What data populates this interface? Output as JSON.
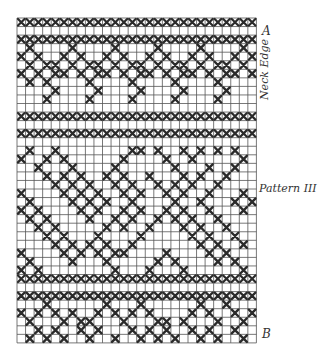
{
  "labels": {
    "top_marker": "A",
    "bottom_marker": "B",
    "neck_edge": "Neck Edge",
    "pattern": "Pattern III"
  },
  "grid": {
    "origin_x": 17,
    "origin_y": 18,
    "cell": 8.55,
    "cols": 28,
    "rows": 38,
    "line_color": "#555555",
    "stitch_color": "#2a2a2a"
  },
  "band_rows": [
    0,
    2,
    11,
    13,
    30,
    32
  ],
  "crosses": [
    [
      3,
      1
    ],
    [
      3,
      6
    ],
    [
      3,
      11
    ],
    [
      3,
      16
    ],
    [
      3,
      21
    ],
    [
      3,
      26
    ],
    [
      4,
      0
    ],
    [
      4,
      2
    ],
    [
      4,
      5
    ],
    [
      4,
      7
    ],
    [
      4,
      10
    ],
    [
      4,
      12
    ],
    [
      4,
      15
    ],
    [
      4,
      17
    ],
    [
      4,
      20
    ],
    [
      4,
      22
    ],
    [
      4,
      25
    ],
    [
      4,
      27
    ],
    [
      5,
      1
    ],
    [
      5,
      3
    ],
    [
      5,
      4
    ],
    [
      5,
      6
    ],
    [
      5,
      8
    ],
    [
      5,
      9
    ],
    [
      5,
      11
    ],
    [
      5,
      13
    ],
    [
      5,
      14
    ],
    [
      5,
      16
    ],
    [
      5,
      18
    ],
    [
      5,
      19
    ],
    [
      5,
      21
    ],
    [
      5,
      23
    ],
    [
      5,
      24
    ],
    [
      5,
      26
    ],
    [
      6,
      0
    ],
    [
      6,
      2
    ],
    [
      6,
      4
    ],
    [
      6,
      5
    ],
    [
      6,
      7
    ],
    [
      6,
      9
    ],
    [
      6,
      10
    ],
    [
      6,
      12
    ],
    [
      6,
      14
    ],
    [
      6,
      15
    ],
    [
      6,
      17
    ],
    [
      6,
      19
    ],
    [
      6,
      20
    ],
    [
      6,
      22
    ],
    [
      6,
      24
    ],
    [
      6,
      25
    ],
    [
      6,
      27
    ],
    [
      7,
      1
    ],
    [
      7,
      3
    ],
    [
      7,
      8
    ],
    [
      7,
      13
    ],
    [
      7,
      18
    ],
    [
      7,
      23
    ],
    [
      8,
      4
    ],
    [
      8,
      9
    ],
    [
      8,
      14
    ],
    [
      8,
      19
    ],
    [
      8,
      24
    ],
    [
      9,
      3
    ],
    [
      9,
      8
    ],
    [
      9,
      13
    ],
    [
      9,
      18
    ],
    [
      9,
      23
    ],
    [
      15,
      1
    ],
    [
      15,
      4
    ],
    [
      15,
      13
    ],
    [
      15,
      14
    ],
    [
      15,
      16
    ],
    [
      15,
      19
    ],
    [
      15,
      21
    ],
    [
      15,
      23
    ],
    [
      15,
      25
    ],
    [
      16,
      0
    ],
    [
      16,
      3
    ],
    [
      16,
      5
    ],
    [
      16,
      12
    ],
    [
      16,
      17
    ],
    [
      16,
      20
    ],
    [
      16,
      26
    ],
    [
      17,
      2
    ],
    [
      17,
      6
    ],
    [
      17,
      11
    ],
    [
      17,
      18
    ],
    [
      17,
      22
    ],
    [
      17,
      25
    ],
    [
      18,
      3
    ],
    [
      18,
      5
    ],
    [
      18,
      7
    ],
    [
      18,
      10
    ],
    [
      18,
      12
    ],
    [
      18,
      15
    ],
    [
      18,
      19
    ],
    [
      18,
      21
    ],
    [
      18,
      24
    ],
    [
      19,
      4
    ],
    [
      19,
      6
    ],
    [
      19,
      8
    ],
    [
      19,
      11
    ],
    [
      19,
      13
    ],
    [
      19,
      16
    ],
    [
      19,
      18
    ],
    [
      19,
      20
    ],
    [
      19,
      23
    ],
    [
      20,
      0
    ],
    [
      20,
      5
    ],
    [
      20,
      7
    ],
    [
      20,
      9
    ],
    [
      20,
      12
    ],
    [
      20,
      14
    ],
    [
      20,
      17
    ],
    [
      20,
      19
    ],
    [
      20,
      22
    ],
    [
      20,
      26
    ],
    [
      21,
      1
    ],
    [
      21,
      6
    ],
    [
      21,
      8
    ],
    [
      21,
      10
    ],
    [
      21,
      13
    ],
    [
      21,
      18
    ],
    [
      21,
      21
    ],
    [
      21,
      25
    ],
    [
      21,
      27
    ],
    [
      22,
      0
    ],
    [
      22,
      2
    ],
    [
      22,
      7
    ],
    [
      22,
      9
    ],
    [
      22,
      12
    ],
    [
      22,
      14
    ],
    [
      22,
      17
    ],
    [
      22,
      19
    ],
    [
      22,
      22
    ],
    [
      22,
      26
    ],
    [
      23,
      1
    ],
    [
      23,
      3
    ],
    [
      23,
      8
    ],
    [
      23,
      11
    ],
    [
      23,
      13
    ],
    [
      23,
      16
    ],
    [
      23,
      18
    ],
    [
      23,
      20
    ],
    [
      23,
      23
    ],
    [
      24,
      2
    ],
    [
      24,
      4
    ],
    [
      24,
      10
    ],
    [
      24,
      12
    ],
    [
      24,
      15
    ],
    [
      24,
      19
    ],
    [
      24,
      21
    ],
    [
      24,
      24
    ],
    [
      25,
      3
    ],
    [
      25,
      5
    ],
    [
      25,
      9
    ],
    [
      25,
      14
    ],
    [
      25,
      20
    ],
    [
      25,
      22
    ],
    [
      25,
      25
    ],
    [
      26,
      4
    ],
    [
      26,
      6
    ],
    [
      26,
      8
    ],
    [
      26,
      10
    ],
    [
      26,
      13
    ],
    [
      26,
      21
    ],
    [
      26,
      23
    ],
    [
      26,
      26
    ],
    [
      27,
      0
    ],
    [
      27,
      5
    ],
    [
      27,
      7
    ],
    [
      27,
      9
    ],
    [
      27,
      11
    ],
    [
      27,
      12
    ],
    [
      27,
      17
    ],
    [
      27,
      22
    ],
    [
      27,
      24
    ],
    [
      28,
      1
    ],
    [
      28,
      6
    ],
    [
      28,
      10
    ],
    [
      28,
      16
    ],
    [
      28,
      18
    ],
    [
      28,
      23
    ],
    [
      28,
      25
    ],
    [
      29,
      0
    ],
    [
      29,
      2
    ],
    [
      29,
      11
    ],
    [
      29,
      15
    ],
    [
      29,
      19
    ],
    [
      29,
      26
    ],
    [
      33,
      3
    ],
    [
      33,
      10
    ],
    [
      33,
      14
    ],
    [
      33,
      21
    ],
    [
      33,
      24
    ],
    [
      34,
      0
    ],
    [
      34,
      2
    ],
    [
      34,
      4
    ],
    [
      34,
      6
    ],
    [
      34,
      9
    ],
    [
      34,
      11
    ],
    [
      34,
      13
    ],
    [
      34,
      15
    ],
    [
      34,
      20
    ],
    [
      34,
      22
    ],
    [
      34,
      25
    ],
    [
      34,
      27
    ],
    [
      35,
      1
    ],
    [
      35,
      5
    ],
    [
      35,
      7
    ],
    [
      35,
      8
    ],
    [
      35,
      12
    ],
    [
      35,
      16
    ],
    [
      35,
      17
    ],
    [
      35,
      19
    ],
    [
      35,
      23
    ],
    [
      35,
      26
    ],
    [
      36,
      2
    ],
    [
      36,
      4
    ],
    [
      36,
      7
    ],
    [
      36,
      9
    ],
    [
      36,
      13
    ],
    [
      36,
      15
    ],
    [
      36,
      17
    ],
    [
      36,
      20
    ],
    [
      36,
      22
    ],
    [
      36,
      25
    ],
    [
      37,
      1
    ],
    [
      37,
      3
    ],
    [
      37,
      5
    ],
    [
      37,
      8
    ],
    [
      37,
      11
    ],
    [
      37,
      14
    ],
    [
      37,
      16
    ],
    [
      37,
      18
    ],
    [
      37,
      21
    ],
    [
      37,
      23
    ],
    [
      37,
      26
    ]
  ]
}
